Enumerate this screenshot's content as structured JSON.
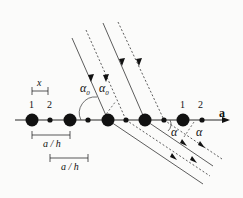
{
  "diagram": {
    "title": "",
    "labels": {
      "period_x": "x",
      "atom1_left": "1",
      "atom2_left": "2",
      "atom1_right": "1",
      "atom2_right": "2",
      "axis_label": "a",
      "spacing1": "a / h",
      "spacing2": "a / h",
      "incident_angle_1": "α",
      "incident_angle_1_sub": "0",
      "incident_angle_2": "α",
      "incident_angle_2_sub": "0",
      "diffracted_angle_1": "α",
      "diffracted_angle_2": "α"
    },
    "atoms": {
      "large_x": [
        32,
        70,
        108,
        145,
        183
      ],
      "small_x": [
        50,
        88,
        126,
        164,
        202
      ],
      "axis_y": 120
    },
    "colors": {
      "ink": "#111111",
      "background": "#fbfbfa"
    }
  }
}
